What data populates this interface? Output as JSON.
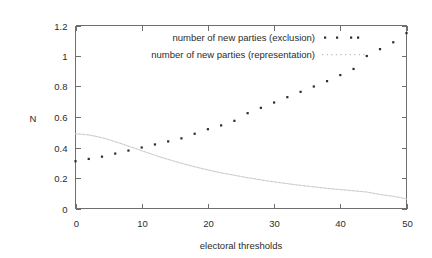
{
  "chart_data": {
    "type": "scatter",
    "title": "",
    "xlabel": "electoral thresholds",
    "ylabel": "N",
    "xlim": [
      0,
      50
    ],
    "ylim": [
      0,
      1.2
    ],
    "xticks": [
      0,
      10,
      20,
      30,
      40,
      50
    ],
    "xtick_labels": [
      "0",
      "10",
      "20",
      "30",
      "40",
      "50"
    ],
    "yticks": [
      0,
      0.2,
      0.4,
      0.6,
      0.8,
      1.0,
      1.2
    ],
    "ytick_labels": [
      "0",
      "0.2",
      "0.4",
      "0.6",
      "0.8",
      "1",
      "1.2"
    ],
    "grid": false,
    "legend_position": "inside upper center",
    "series": [
      {
        "name": "number of new parties (exclusion)",
        "marker": "dot",
        "color": "#2b2b2b",
        "x": [
          0,
          2,
          4,
          6,
          8,
          10,
          12,
          14,
          16,
          18,
          20,
          22,
          24,
          26,
          28,
          30,
          32,
          34,
          36,
          38,
          40,
          42,
          44,
          46,
          48,
          50
        ],
        "y": [
          0.31,
          0.325,
          0.34,
          0.36,
          0.38,
          0.4,
          0.42,
          0.44,
          0.46,
          0.49,
          0.52,
          0.545,
          0.575,
          0.625,
          0.66,
          0.695,
          0.73,
          0.765,
          0.8,
          0.835,
          0.875,
          0.915,
          1.0,
          1.045,
          1.09,
          1.15
        ]
      },
      {
        "name": "number of new parties (representation)",
        "marker": "fine-dot",
        "color": "#c2c2c2",
        "x": [
          0,
          1,
          2,
          3,
          4,
          5,
          6,
          7,
          8,
          9,
          10,
          11,
          12,
          13,
          14,
          15,
          16,
          17,
          18,
          19,
          20,
          21,
          22,
          23,
          24,
          25,
          26,
          27,
          28,
          29,
          30,
          31,
          32,
          33,
          34,
          35,
          36,
          37,
          38,
          39,
          40,
          41,
          42,
          43,
          44,
          45,
          46,
          47,
          48,
          49,
          50
        ],
        "y": [
          0.49,
          0.487,
          0.482,
          0.474,
          0.464,
          0.452,
          0.438,
          0.424,
          0.409,
          0.394,
          0.379,
          0.364,
          0.349,
          0.335,
          0.322,
          0.309,
          0.297,
          0.285,
          0.274,
          0.263,
          0.253,
          0.243,
          0.234,
          0.226,
          0.218,
          0.21,
          0.202,
          0.195,
          0.188,
          0.181,
          0.175,
          0.169,
          0.163,
          0.157,
          0.152,
          0.147,
          0.142,
          0.137,
          0.132,
          0.128,
          0.124,
          0.12,
          0.116,
          0.112,
          0.108,
          0.1,
          0.092,
          0.086,
          0.08,
          0.072,
          0.062
        ]
      }
    ]
  },
  "legend": {
    "entries": [
      {
        "label": "number of new parties (exclusion)"
      },
      {
        "label": "number of new parties (representation)"
      }
    ]
  }
}
